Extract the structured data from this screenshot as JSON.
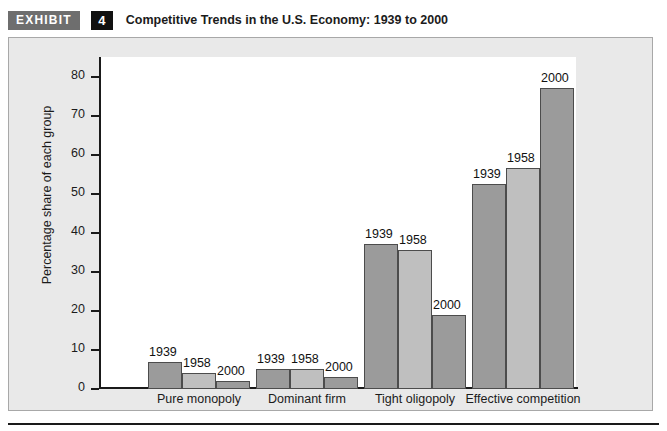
{
  "header": {
    "badge_label": "EXHIBIT",
    "exhibit_number": "4",
    "title": "Competitive Trends in the U.S. Economy: 1939 to 2000"
  },
  "colors": {
    "bar_dark": "#9b9b9b",
    "bar_light": "#bfbfbf",
    "bar_border": "#4c4c4c",
    "panel_background": "#e9e9e9",
    "plot_background": "#ffffff",
    "axis": "#1a1a1a",
    "badge_background": "#6e6e6e",
    "number_background": "#111111"
  },
  "chart_data": {
    "type": "bar",
    "title": "Competitive Trends in the U.S. Economy: 1939 to 2000",
    "xlabel": "",
    "ylabel": "Percentage share of each group",
    "ylim": [
      0,
      85
    ],
    "grid": false,
    "legend_position": "none",
    "data_labels": true,
    "y_ticks": [
      0,
      10,
      20,
      30,
      40,
      50,
      60,
      70,
      80
    ],
    "y_tick_labels": [
      "0",
      "10",
      "20",
      "30",
      "40",
      "50",
      "60",
      "70",
      "80"
    ],
    "categories": [
      "Pure monopoly",
      "Dominant firm",
      "Tight oligopoly",
      "Effective competition"
    ],
    "series": [
      {
        "name": "1939",
        "values": [
          7,
          5,
          37,
          52.5
        ]
      },
      {
        "name": "1958",
        "values": [
          4,
          5,
          35.5,
          56.5
        ]
      },
      {
        "name": "2000",
        "values": [
          2,
          3,
          19,
          77
        ]
      }
    ],
    "bar_labels": [
      [
        "1939",
        "1958",
        "2000"
      ],
      [
        "1939",
        "1958",
        "2000"
      ],
      [
        "1939",
        "1958",
        "2000"
      ],
      [
        "1939",
        "1958",
        "2000"
      ]
    ]
  }
}
